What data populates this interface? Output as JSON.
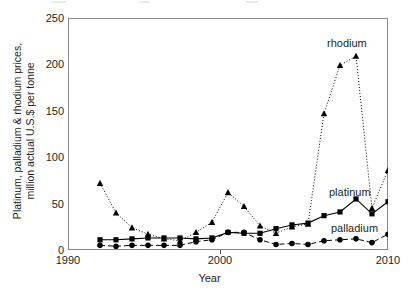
{
  "chart_data": {
    "type": "line",
    "title": "",
    "xlabel": "Year",
    "ylabel": "Platinum, palladium & rhodium prices, million actual U.S.$ per tonne",
    "xlim": [
      1990,
      2010
    ],
    "ylim": [
      0,
      250
    ],
    "xticks": [
      1990,
      2000,
      2010
    ],
    "yticks": [
      0,
      50,
      100,
      150,
      200,
      250
    ],
    "grid": false,
    "legend_position": "inline-annotations",
    "x": [
      1992,
      1993,
      1994,
      1995,
      1996,
      1997,
      1998,
      1999,
      2000,
      2001,
      2002,
      2003,
      2004,
      2005,
      2006,
      2007,
      2008,
      2009,
      2010
    ],
    "series": [
      {
        "name": "rhodium",
        "marker": "triangle",
        "line_style": "dotted",
        "color": "#000000",
        "values": [
          72,
          40,
          24,
          17,
          12,
          10,
          19,
          30,
          62,
          47,
          26,
          18,
          25,
          28,
          147,
          199,
          209,
          45,
          86
        ]
      },
      {
        "name": "platinum",
        "marker": "square",
        "line_style": "solid",
        "color": "#000000",
        "values": [
          11,
          11,
          12,
          13,
          13,
          13,
          12,
          13,
          19,
          18,
          18,
          23,
          27,
          29,
          37,
          41,
          55,
          39,
          52
        ]
      },
      {
        "name": "palladium",
        "marker": "circle",
        "line_style": "dashed",
        "color": "#000000",
        "values": [
          5,
          4,
          5,
          5,
          5,
          5,
          9,
          11,
          19,
          19,
          11,
          6,
          7,
          6,
          10,
          11,
          12,
          8,
          17
        ]
      }
    ],
    "annotations": [
      {
        "text": "rhodium",
        "x": 2006.0,
        "y": 228
      },
      {
        "text": "platinum",
        "x": 2006.1,
        "y": 66
      },
      {
        "text": "palladium",
        "x": 2006.2,
        "y": 28
      }
    ]
  },
  "axes": {
    "x_title": "Year",
    "y_title_line1": "Platinum, palladium & rhodium prices,",
    "y_title_line2": "million actual U.S.$ per tonne",
    "x_tick_labels": [
      "1990",
      "2000",
      "2010"
    ],
    "y_tick_labels": [
      "0",
      "50",
      "100",
      "150",
      "200",
      "250"
    ]
  },
  "colors": {
    "axis": "#8a8a8a",
    "tick": "#5a5a5a",
    "text": "#231f20",
    "series": "#000000",
    "background": "#ffffff"
  }
}
